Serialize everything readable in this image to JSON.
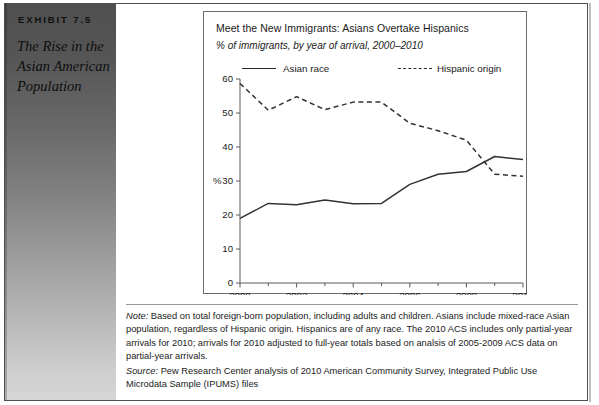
{
  "exhibit": {
    "label": "EXHIBIT 7.5",
    "title": "The Rise in the Asian American Population"
  },
  "chart": {
    "title": "Meet the New Immigrants: Asians Overtake Hispanics",
    "subtitle": "% of immigrants, by year of arrival, 2000–2010",
    "legend": [
      {
        "label": "Asian race",
        "style": "solid"
      },
      {
        "label": "Hispanic origin",
        "style": "dashed"
      }
    ]
  },
  "chart_data": {
    "type": "line",
    "title": "Meet the New Immigrants: Asians Overtake Hispanics",
    "subtitle": "% of immigrants, by year of arrival, 2000–2010",
    "xlabel": "",
    "ylabel": "%",
    "x": [
      2000,
      2001,
      2002,
      2003,
      2004,
      2005,
      2006,
      2007,
      2008,
      2009,
      2010
    ],
    "xlim": [
      2000,
      2010
    ],
    "ylim": [
      0,
      60
    ],
    "yticks": [
      0,
      10,
      20,
      30,
      40,
      50,
      60
    ],
    "xticks": [
      2000,
      2002,
      2004,
      2006,
      2008,
      2010
    ],
    "xticks_minor": [
      2001,
      2003,
      2005,
      2007,
      2009
    ],
    "grid": false,
    "legend_position": "top",
    "series": [
      {
        "name": "Asian race",
        "style": "solid",
        "values": [
          19.0,
          23.4,
          23.0,
          24.4,
          23.3,
          23.4,
          29.0,
          32.0,
          32.8,
          37.2,
          36.3
        ]
      },
      {
        "name": "Hispanic origin",
        "style": "dashed",
        "values": [
          58.7,
          50.8,
          54.8,
          51.0,
          53.2,
          53.2,
          47.0,
          44.8,
          42.0,
          32.0,
          31.4
        ]
      }
    ]
  },
  "footnotes": {
    "note_lead": "Note:",
    "note_text": " Based on total foreign-born population, including adults and children. Asians include mixed-race Asian population, regardless of Hispanic origin. Hispanics are of any race. The 2010 ACS includes only partial-year arrivals for 2010; arrivals for 2010 adjusted to full-year totals based on analsis of 2005-2009 ACS data on partial-year arrivals.",
    "source_lead": "Source:",
    "source_text": " Pew Research Center analysis of 2010 American Community Survey, Integrated Public Use Microdata Sample (IPUMS) files"
  },
  "colors": {
    "series_line": "#333333",
    "axis": "#5a5a5a",
    "page_border": "#4e4e4e",
    "sidebar_top": "#4f4f4f",
    "sidebar_bottom": "#d6d6d6"
  }
}
